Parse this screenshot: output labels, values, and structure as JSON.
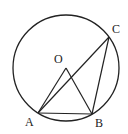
{
  "diagram": {
    "type": "geometry-circle-inscribed-triangle",
    "stroke_color": "#222222",
    "background": "#ffffff",
    "circle": {
      "center": "O",
      "cx": 66,
      "cy": 68,
      "r": 53
    },
    "points": {
      "O": {
        "label": "O",
        "x": 66,
        "y": 68,
        "label_x": 54,
        "label_y": 63
      },
      "A": {
        "label": "A",
        "x": 38,
        "y": 113,
        "label_x": 25,
        "label_y": 126
      },
      "B": {
        "label": "B",
        "x": 92,
        "y": 114,
        "label_x": 95,
        "label_y": 127
      },
      "C": {
        "label": "C",
        "x": 109,
        "y": 37,
        "label_x": 112,
        "label_y": 33
      }
    },
    "segments": [
      [
        "O",
        "A"
      ],
      [
        "O",
        "B"
      ],
      [
        "A",
        "B"
      ],
      [
        "A",
        "C"
      ],
      [
        "B",
        "C"
      ]
    ]
  }
}
